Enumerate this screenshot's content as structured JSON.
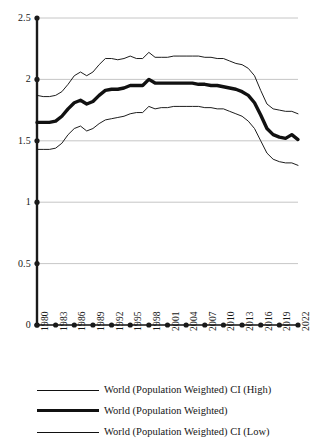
{
  "chart_data": {
    "type": "line",
    "title": "",
    "subtitle": "",
    "xlabel": "",
    "ylabel": "",
    "xlim": [
      1980,
      2022
    ],
    "ylim": [
      0,
      2.5
    ],
    "grid": true,
    "legend_position": "bottom",
    "y_ticks": [
      "0",
      "0.5",
      "1",
      "1.5",
      "2",
      "2.5"
    ],
    "y_tick_values": [
      0,
      0.5,
      1,
      1.5,
      2,
      2.5
    ],
    "x_ticks": [
      "1980",
      "1983",
      "1986",
      "1989",
      "1992",
      "1995",
      "1998",
      "2001",
      "2004",
      "2007",
      "2010",
      "2013",
      "2016",
      "2019",
      "2022"
    ],
    "x_tick_values": [
      1980,
      1983,
      1986,
      1989,
      1992,
      1995,
      1998,
      2001,
      2004,
      2007,
      2010,
      2013,
      2016,
      2019,
      2022
    ],
    "x": [
      1980,
      1981,
      1982,
      1983,
      1984,
      1985,
      1986,
      1987,
      1988,
      1989,
      1990,
      1991,
      1992,
      1993,
      1994,
      1995,
      1996,
      1997,
      1998,
      1999,
      2000,
      2001,
      2002,
      2003,
      2004,
      2005,
      2006,
      2007,
      2008,
      2009,
      2010,
      2011,
      2012,
      2013,
      2014,
      2015,
      2016,
      2017,
      2018,
      2019,
      2020,
      2021,
      2022
    ],
    "series": [
      {
        "name": "World (Population Weighted) CI (High)",
        "style": "thin",
        "color": "#111111",
        "values": [
          1.87,
          1.86,
          1.86,
          1.87,
          1.9,
          1.96,
          2.03,
          2.06,
          2.03,
          2.06,
          2.12,
          2.17,
          2.17,
          2.16,
          2.17,
          2.19,
          2.17,
          2.17,
          2.22,
          2.18,
          2.18,
          2.18,
          2.19,
          2.19,
          2.19,
          2.19,
          2.19,
          2.18,
          2.18,
          2.17,
          2.17,
          2.15,
          2.13,
          2.12,
          2.09,
          2.03,
          1.91,
          1.8,
          1.76,
          1.75,
          1.74,
          1.74,
          1.72
        ]
      },
      {
        "name": "World (Population Weighted)",
        "style": "thick",
        "color": "#111111",
        "values": [
          1.65,
          1.65,
          1.65,
          1.66,
          1.7,
          1.76,
          1.81,
          1.83,
          1.8,
          1.82,
          1.87,
          1.91,
          1.92,
          1.92,
          1.93,
          1.95,
          1.95,
          1.95,
          2.0,
          1.97,
          1.97,
          1.97,
          1.97,
          1.97,
          1.97,
          1.97,
          1.96,
          1.96,
          1.95,
          1.95,
          1.94,
          1.93,
          1.92,
          1.9,
          1.87,
          1.81,
          1.71,
          1.6,
          1.55,
          1.53,
          1.52,
          1.55,
          1.51
        ]
      },
      {
        "name": "World (Population Weighted) CI (Low)",
        "style": "thin",
        "color": "#111111",
        "values": [
          1.43,
          1.43,
          1.43,
          1.44,
          1.48,
          1.55,
          1.6,
          1.62,
          1.58,
          1.6,
          1.64,
          1.67,
          1.68,
          1.69,
          1.7,
          1.72,
          1.73,
          1.73,
          1.78,
          1.76,
          1.77,
          1.77,
          1.78,
          1.78,
          1.78,
          1.78,
          1.78,
          1.77,
          1.77,
          1.76,
          1.76,
          1.74,
          1.72,
          1.7,
          1.66,
          1.6,
          1.5,
          1.4,
          1.35,
          1.33,
          1.32,
          1.32,
          1.3
        ]
      }
    ]
  },
  "legend": {
    "entries": [
      {
        "label": "World (Population Weighted) CI (High)",
        "style": "thin"
      },
      {
        "label": "World (Population Weighted)",
        "style": "thick"
      },
      {
        "label": "World (Population Weighted) CI (Low)",
        "style": "thin"
      }
    ]
  },
  "colors": {
    "line": "#111111",
    "axis": "#1a1a1a",
    "grid": "#b8b8b8",
    "background": "#ffffff"
  }
}
